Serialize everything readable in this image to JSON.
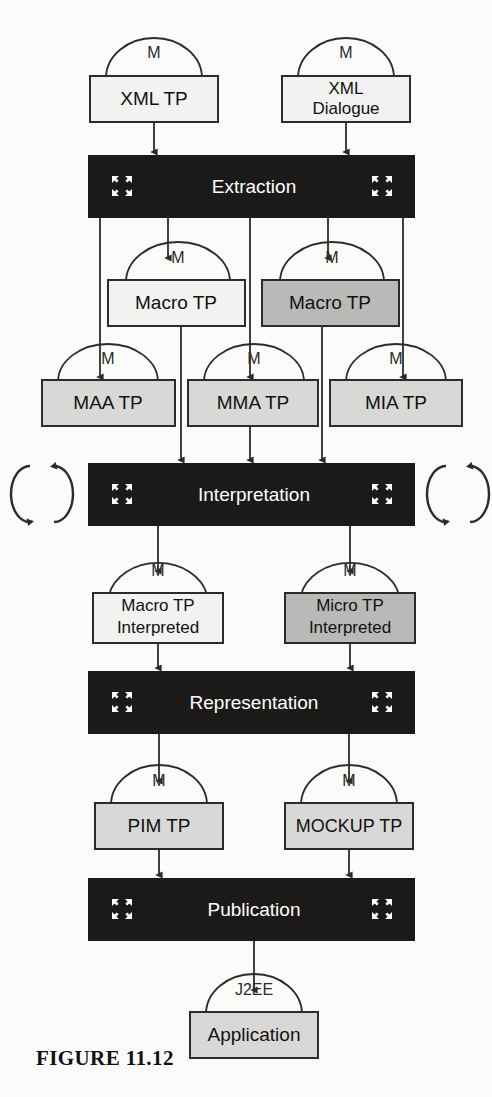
{
  "figure": {
    "caption": "FIGURE 11.12"
  },
  "colors": {
    "page_background": "#fbfbfa",
    "stage_fill": "#1c1a18",
    "stage_text": "#ffffff",
    "box_stroke": "#2b2b2b",
    "box_fill_white": "#f2f2f0",
    "box_fill_light_gray": "#d8d8d6",
    "box_fill_dark_gray": "#b9b9b7",
    "arrow": "#2b2b2b",
    "caption_text": "#111111"
  },
  "stages": [
    {
      "id": "extraction",
      "label": "Extraction",
      "x": 88,
      "y": 155,
      "w": 327,
      "h": 63
    },
    {
      "id": "interpretation",
      "label": "Interpretation",
      "x": 88,
      "y": 463,
      "w": 327,
      "h": 63
    },
    {
      "id": "representation",
      "label": "Representation",
      "x": 88,
      "y": 671,
      "w": 327,
      "h": 63
    },
    {
      "id": "publication",
      "label": "Publication",
      "x": 88,
      "y": 878,
      "w": 327,
      "h": 63
    }
  ],
  "artifacts": [
    {
      "id": "xml-tp",
      "lines": [
        "XML TP"
      ],
      "arc_label": "M",
      "fill": "white",
      "x": 90,
      "y": 76,
      "w": 128,
      "h": 46
    },
    {
      "id": "xml-dialogue",
      "lines": [
        "XML",
        "Dialogue"
      ],
      "arc_label": "M",
      "fill": "white",
      "x": 282,
      "y": 76,
      "w": 128,
      "h": 46
    },
    {
      "id": "macro-tp-left",
      "lines": [
        "Macro TP"
      ],
      "arc_label": "M",
      "fill": "white",
      "x": 108,
      "y": 280,
      "w": 137,
      "h": 46
    },
    {
      "id": "macro-tp-right",
      "lines": [
        "Macro TP"
      ],
      "arc_label": "M",
      "fill": "dark-gray",
      "x": 262,
      "y": 280,
      "w": 137,
      "h": 46
    },
    {
      "id": "maa-tp",
      "lines": [
        "MAA TP"
      ],
      "arc_label": "M",
      "fill": "light-gray",
      "x": 42,
      "y": 380,
      "w": 133,
      "h": 46
    },
    {
      "id": "mma-tp",
      "lines": [
        "MMA TP"
      ],
      "arc_label": "M",
      "fill": "light-gray",
      "x": 188,
      "y": 380,
      "w": 130,
      "h": 46
    },
    {
      "id": "mia-tp",
      "lines": [
        "MIA TP"
      ],
      "arc_label": "M",
      "fill": "light-gray",
      "x": 330,
      "y": 380,
      "w": 132,
      "h": 46
    },
    {
      "id": "macro-tp-interp",
      "lines": [
        "Macro TP",
        "Interpreted"
      ],
      "arc_label": "M",
      "fill": "white",
      "x": 93,
      "y": 593,
      "w": 130,
      "h": 50
    },
    {
      "id": "micro-tp-interp",
      "lines": [
        "Micro TP",
        "Interpreted"
      ],
      "arc_label": "M",
      "fill": "dark-gray",
      "x": 285,
      "y": 593,
      "w": 130,
      "h": 50
    },
    {
      "id": "pim-tp",
      "lines": [
        "PIM TP"
      ],
      "arc_label": "M",
      "fill": "light-gray",
      "x": 95,
      "y": 803,
      "w": 128,
      "h": 46
    },
    {
      "id": "mockup-tp",
      "lines": [
        "MOCKUP TP"
      ],
      "arc_label": "M",
      "fill": "light-gray",
      "x": 285,
      "y": 803,
      "w": 128,
      "h": 46
    },
    {
      "id": "application",
      "lines": [
        "Application"
      ],
      "arc_label": "J2EE",
      "fill": "light-gray",
      "x": 190,
      "y": 1012,
      "w": 128,
      "h": 46
    }
  ],
  "loop_icons": [
    {
      "id": "loop-left",
      "cx": 42,
      "cy": 494,
      "side": "left"
    },
    {
      "id": "loop-right",
      "cx": 458,
      "cy": 494,
      "side": "right"
    }
  ],
  "stage_corner_icons": {
    "name": "four-arrow-expand-icon",
    "count_per_stage": 2
  },
  "flows": [
    {
      "from": "xml-tp",
      "to": "extraction"
    },
    {
      "from": "xml-dialogue",
      "to": "extraction"
    },
    {
      "from": "extraction",
      "to": "maa-tp"
    },
    {
      "from": "extraction",
      "to": "macro-tp-left"
    },
    {
      "from": "extraction",
      "to": "mma-tp"
    },
    {
      "from": "extraction",
      "to": "macro-tp-right"
    },
    {
      "from": "extraction",
      "to": "mia-tp"
    },
    {
      "from": "macro-tp-left",
      "to": "interpretation"
    },
    {
      "from": "mma-tp",
      "to": "interpretation"
    },
    {
      "from": "macro-tp-right",
      "to": "interpretation"
    },
    {
      "from": "interpretation",
      "to": "macro-tp-interp"
    },
    {
      "from": "interpretation",
      "to": "micro-tp-interp"
    },
    {
      "from": "macro-tp-interp",
      "to": "representation"
    },
    {
      "from": "micro-tp-interp",
      "to": "representation"
    },
    {
      "from": "representation",
      "to": "pim-tp"
    },
    {
      "from": "representation",
      "to": "mockup-tp"
    },
    {
      "from": "pim-tp",
      "to": "publication"
    },
    {
      "from": "mockup-tp",
      "to": "publication"
    },
    {
      "from": "publication",
      "to": "application"
    }
  ]
}
